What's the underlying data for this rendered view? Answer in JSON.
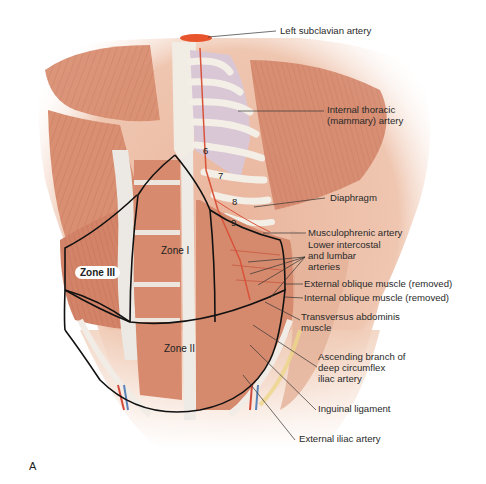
{
  "figure": {
    "panel_letter": "A",
    "zones": {
      "zone_1": "Zone I",
      "zone_2": "Zone II",
      "zone_3": "Zone III"
    },
    "rib_numbers": [
      "6",
      "7",
      "8",
      "9"
    ],
    "labels": [
      "Left subclavian artery",
      "Internal thoracic\n(mammary) artery",
      "Diaphragm",
      "Musculophrenic artery",
      "Lower intercostal\nand lumbar\narteries",
      "External oblique muscle (removed)",
      "Internal oblique muscle (removed)",
      "Transversus abdominis\nmuscle",
      "Ascending branch of\ndeep circumflex\niliac artery",
      "Inguinal ligament",
      "External iliac artery"
    ],
    "colors": {
      "muscle": "#d98f72",
      "muscle_dark": "#c3735a",
      "fascia": "#e9e6e2",
      "rib": "#f3efe6",
      "lung": "#d9c7d6",
      "artery": "#e2502f",
      "subclavian": "#e8552c",
      "skin": "#f2d3bf",
      "outline": "#111111",
      "leader": "#333333"
    }
  }
}
